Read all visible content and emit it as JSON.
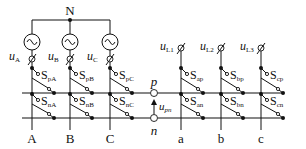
{
  "diagram": {
    "type": "matrix-converter-circuit",
    "neutral_label": "N",
    "sources": [
      {
        "id": "A",
        "voltage_main": "u",
        "voltage_sub": "A"
      },
      {
        "id": "B",
        "voltage_main": "u",
        "voltage_sub": "B"
      },
      {
        "id": "C",
        "voltage_main": "u",
        "voltage_sub": "C"
      }
    ],
    "input_phases": [
      "A",
      "B",
      "C"
    ],
    "output_phases": [
      "a",
      "b",
      "c"
    ],
    "loads": [
      {
        "main": "u",
        "sub": "L1"
      },
      {
        "main": "u",
        "sub": "L2"
      },
      {
        "main": "u",
        "sub": "L3"
      }
    ],
    "dc_link": {
      "p_label": "p",
      "n_label": "n",
      "voltage_main": "u",
      "voltage_sub": "pn"
    },
    "switches_upper_input": [
      {
        "main": "S",
        "sub": "pA"
      },
      {
        "main": "S",
        "sub": "pB"
      },
      {
        "main": "S",
        "sub": "pC"
      }
    ],
    "switches_lower_input": [
      {
        "main": "S",
        "sub": "nA"
      },
      {
        "main": "S",
        "sub": "nB"
      },
      {
        "main": "S",
        "sub": "nC"
      }
    ],
    "switches_upper_output": [
      {
        "main": "S",
        "sub": "ap"
      },
      {
        "main": "S",
        "sub": "bp"
      },
      {
        "main": "S",
        "sub": "cp"
      }
    ],
    "switches_lower_output": [
      {
        "main": "S",
        "sub": "an"
      },
      {
        "main": "S",
        "sub": "bn"
      },
      {
        "main": "S",
        "sub": "cn"
      }
    ]
  }
}
